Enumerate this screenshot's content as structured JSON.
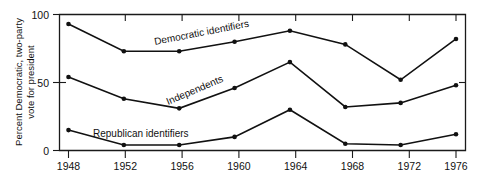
{
  "chart_data": {
    "type": "line",
    "title": "",
    "xlabel": "",
    "ylabel": "Percent Democratic, two-party vote for president",
    "ylabel_line1": "Percent Democratic, two-party",
    "ylabel_line2": "vote for president",
    "categories": [
      "1948",
      "1952",
      "1956",
      "1960",
      "1964",
      "1968",
      "1972",
      "1976"
    ],
    "x": [
      1948,
      1952,
      1956,
      1960,
      1964,
      1968,
      1972,
      1976
    ],
    "ylim": [
      0,
      100
    ],
    "xlim": [
      1946,
      1978
    ],
    "yticks": [
      "0",
      "50",
      "100"
    ],
    "ytick_values": [
      0,
      50,
      100
    ],
    "grid": false,
    "legend_position": "inline-annotations",
    "series": [
      {
        "name": "Democratic identifiers",
        "label": "Democratic identifiers",
        "values": [
          93,
          73,
          73,
          80,
          88,
          78,
          52,
          82
        ],
        "color": "#111111"
      },
      {
        "name": "Independents",
        "label": "Independents",
        "values": [
          54,
          38,
          31,
          46,
          65,
          32,
          35,
          48
        ],
        "color": "#111111"
      },
      {
        "name": "Republican identifiers",
        "label": "Republican identifiers",
        "values": [
          15,
          4,
          4,
          10,
          30,
          5,
          4,
          12
        ],
        "color": "#111111"
      }
    ],
    "annotations": [
      {
        "text": "Democratic identifiers",
        "x": 1957.5,
        "y": 84,
        "rotation": -11
      },
      {
        "text": "Independents",
        "x": 1958.5,
        "y": 40,
        "rotation": -23
      },
      {
        "text": "Republican identifiers",
        "x": 1956.5,
        "y": 16,
        "rotation": 0
      }
    ]
  }
}
